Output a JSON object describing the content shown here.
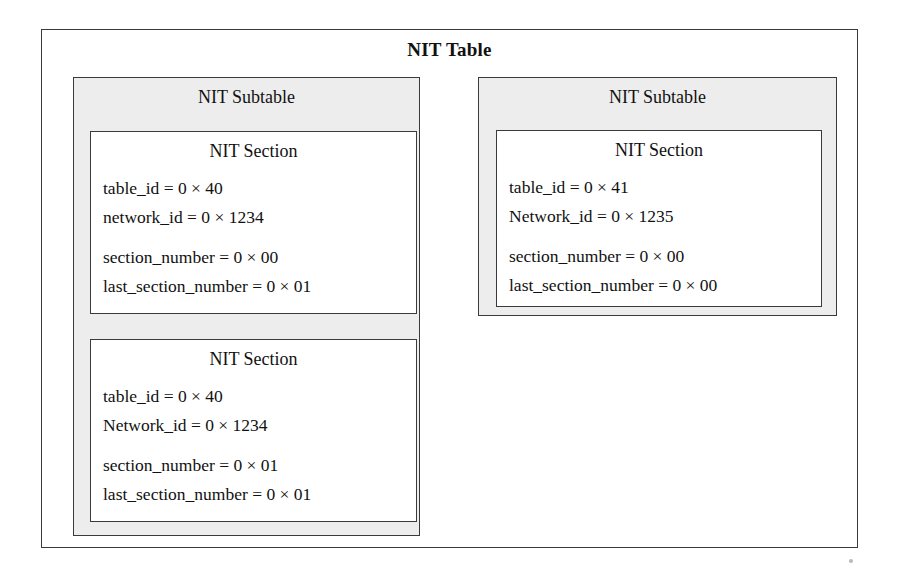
{
  "diagram": {
    "title": "NIT Table",
    "subtables": [
      {
        "title": "NIT Subtable",
        "sections": [
          {
            "title": "NIT Section",
            "fields": [
              "table_id = 0 × 40",
              "network_id = 0 × 1234",
              "section_number = 0 × 00",
              "last_section_number = 0 × 01"
            ]
          },
          {
            "title": "NIT Section",
            "fields": [
              "table_id = 0 × 40",
              "Network_id = 0 × 1234",
              "section_number = 0 × 01",
              "last_section_number = 0 × 01"
            ]
          }
        ]
      },
      {
        "title": "NIT Subtable",
        "sections": [
          {
            "title": "NIT Section",
            "fields": [
              "table_id = 0 × 41",
              "Network_id = 0 × 1235",
              "section_number = 0 × 00",
              "last_section_number = 0 × 00"
            ]
          }
        ]
      }
    ],
    "colors": {
      "border": "#3a3a3a",
      "subtable_fill": "#ededed",
      "section_fill": "#ffffff",
      "text": "#111111"
    }
  }
}
